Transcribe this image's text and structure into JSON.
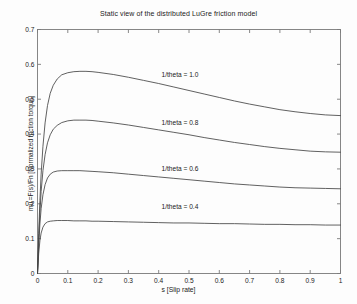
{
  "chart_data": {
    "type": "line",
    "title": "Static view of the distributed LuGre friction model",
    "xlabel": "s [Slip rate]",
    "ylabel": "mu =F(s)/Fn [Normalized friction torque]",
    "xlim": [
      0,
      1
    ],
    "ylim": [
      0,
      0.7
    ],
    "xticks": [
      "0",
      "0.1",
      "0.2",
      "0.3",
      "0.4",
      "0.5",
      "0.6",
      "0.7",
      "0.8",
      "0.9",
      "1"
    ],
    "xtick_values": [
      0,
      0.1,
      0.2,
      0.3,
      0.4,
      0.5,
      0.6,
      0.7,
      0.8,
      0.9,
      1
    ],
    "yticks": [
      "0",
      "0.1",
      "0.2",
      "0.3",
      "0.4",
      "0.5",
      "0.6",
      "0.7"
    ],
    "ytick_values": [
      0,
      0.1,
      0.2,
      0.3,
      0.4,
      0.5,
      0.6,
      0.7
    ],
    "grid": false,
    "legend": "none",
    "line_color": "#444444",
    "background": "#ffffff",
    "annotations": [
      {
        "text": "1/theta = 1.0",
        "x": 0.47,
        "y": 0.565
      },
      {
        "text": "1/theta = 0.8",
        "x": 0.47,
        "y": 0.425
      },
      {
        "text": "1/theta = 0.6",
        "x": 0.47,
        "y": 0.295
      },
      {
        "text": "1/theta = 0.4",
        "x": 0.47,
        "y": 0.185
      }
    ],
    "x": [
      0,
      0.004,
      0.008,
      0.012,
      0.018,
      0.025,
      0.033,
      0.042,
      0.052,
      0.065,
      0.08,
      0.1,
      0.12,
      0.14,
      0.16,
      0.18,
      0.2,
      0.25,
      0.3,
      0.35,
      0.4,
      0.45,
      0.5,
      0.55,
      0.6,
      0.65,
      0.7,
      0.75,
      0.8,
      0.85,
      0.9,
      0.95,
      1.0
    ],
    "series": [
      {
        "name": "1/theta = 1.0",
        "peak_value": 0.58,
        "peak_x": 0.15,
        "end_value": 0.453,
        "values": [
          0.0,
          0.115,
          0.21,
          0.285,
          0.365,
          0.432,
          0.482,
          0.517,
          0.54,
          0.558,
          0.57,
          0.576,
          0.579,
          0.58,
          0.58,
          0.579,
          0.577,
          0.571,
          0.563,
          0.554,
          0.545,
          0.535,
          0.525,
          0.515,
          0.505,
          0.495,
          0.486,
          0.478,
          0.47,
          0.464,
          0.459,
          0.455,
          0.453
        ]
      },
      {
        "name": "1/theta = 0.8",
        "peak_value": 0.44,
        "peak_x": 0.135,
        "end_value": 0.348,
        "values": [
          0.0,
          0.098,
          0.175,
          0.235,
          0.295,
          0.341,
          0.375,
          0.398,
          0.414,
          0.425,
          0.433,
          0.438,
          0.44,
          0.44,
          0.44,
          0.439,
          0.437,
          0.432,
          0.426,
          0.419,
          0.412,
          0.405,
          0.398,
          0.39,
          0.383,
          0.376,
          0.37,
          0.364,
          0.359,
          0.355,
          0.351,
          0.349,
          0.348
        ]
      },
      {
        "name": "1/theta = 0.6",
        "peak_value": 0.295,
        "peak_x": 0.125,
        "end_value": 0.243,
        "values": [
          0.0,
          0.082,
          0.142,
          0.186,
          0.226,
          0.255,
          0.274,
          0.285,
          0.291,
          0.294,
          0.295,
          0.295,
          0.295,
          0.295,
          0.294,
          0.293,
          0.292,
          0.289,
          0.285,
          0.281,
          0.277,
          0.273,
          0.269,
          0.265,
          0.261,
          0.257,
          0.254,
          0.251,
          0.248,
          0.246,
          0.245,
          0.244,
          0.243
        ]
      },
      {
        "name": "1/theta = 0.4",
        "peak_value": 0.152,
        "peak_x": 0.1,
        "end_value": 0.139,
        "values": [
          0.0,
          0.058,
          0.094,
          0.116,
          0.133,
          0.143,
          0.148,
          0.15,
          0.151,
          0.152,
          0.152,
          0.152,
          0.151,
          0.151,
          0.151,
          0.15,
          0.15,
          0.149,
          0.148,
          0.147,
          0.146,
          0.145,
          0.145,
          0.144,
          0.143,
          0.143,
          0.142,
          0.141,
          0.141,
          0.14,
          0.14,
          0.139,
          0.139
        ]
      }
    ]
  }
}
